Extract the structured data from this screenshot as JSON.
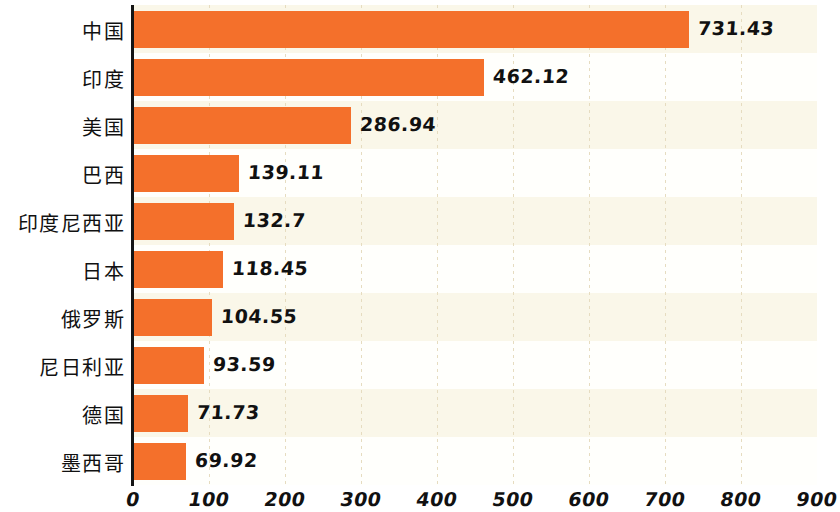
{
  "chart_data": {
    "type": "bar",
    "orientation": "horizontal",
    "title": "",
    "subtitle": "",
    "xlabel": "",
    "ylabel": "",
    "xlim": [
      0,
      900
    ],
    "xticks": [
      0,
      100,
      200,
      300,
      400,
      500,
      600,
      700,
      800,
      900
    ],
    "xtick_labels": [
      "0",
      "100",
      "200",
      "300",
      "400",
      "500",
      "600",
      "700",
      "800",
      "900"
    ],
    "grid": "vertical-dotted",
    "legend": "none",
    "bar_color": "#f4702b",
    "band_color_odd": "#faf7e9",
    "band_color_even": "#fffffc",
    "axis_color": "#151515",
    "gridline_color": "#e6dcc0",
    "categories": [
      "中国",
      "印度",
      "美国",
      "巴西",
      "印度尼西亚",
      "日本",
      "俄罗斯",
      "尼日利亚",
      "德国",
      "墨西哥"
    ],
    "values": [
      731.43,
      462.12,
      286.94,
      139.11,
      132.7,
      118.45,
      104.55,
      93.59,
      71.73,
      69.92
    ],
    "value_labels": [
      "731.43",
      "462.12",
      "286.94",
      "139.11",
      "132.7",
      "118.45",
      "104.55",
      "93.59",
      "71.73",
      "69.92"
    ]
  }
}
